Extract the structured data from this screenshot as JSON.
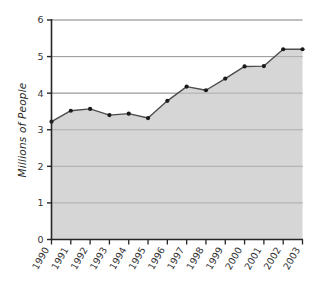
{
  "chart_data": {
    "type": "area",
    "title": "",
    "subtitle": "",
    "xlabel": "",
    "ylabel": "Millions of People",
    "categories": [
      "1990",
      "1991",
      "1992",
      "1993",
      "1994",
      "1995",
      "1996",
      "1997",
      "1998",
      "1999",
      "2000",
      "2001",
      "2002",
      "2003"
    ],
    "values": [
      3.22,
      3.52,
      3.57,
      3.4,
      3.44,
      3.32,
      3.79,
      4.18,
      4.08,
      4.4,
      4.73,
      4.74,
      5.2,
      5.2
    ],
    "series": [
      {
        "name": "Millions of People",
        "values": [
          3.22,
          3.52,
          3.57,
          3.4,
          3.44,
          3.32,
          3.79,
          4.18,
          4.08,
          4.4,
          4.73,
          4.74,
          5.2,
          5.2
        ]
      }
    ],
    "ylim": [
      0,
      6
    ],
    "xlim": [
      "1990",
      "2003"
    ],
    "y_ticks": [
      "0",
      "1",
      "2",
      "3",
      "4",
      "5",
      "6"
    ],
    "y_tick_values": [
      0,
      1,
      2,
      3,
      4,
      5,
      6
    ],
    "x_ticks": [
      "1990",
      "1991",
      "1992",
      "1993",
      "1994",
      "1995",
      "1996",
      "1997",
      "1998",
      "1999",
      "2000",
      "2001",
      "2002",
      "2003"
    ],
    "grid": true,
    "grid_orientation": "horizontal",
    "legend": false,
    "legend_position": "none",
    "markers": true,
    "annotations": []
  },
  "style": {
    "area_fill": "#d6d6d6",
    "line_color": "#4d4d4d",
    "marker_color": "#1a1a1a",
    "grid_color": "#9a9a9a",
    "axis_color": "#262626",
    "text_color": "#333333",
    "background": "#ffffff"
  },
  "labels": {
    "y_axis_title": "Millions of People"
  }
}
